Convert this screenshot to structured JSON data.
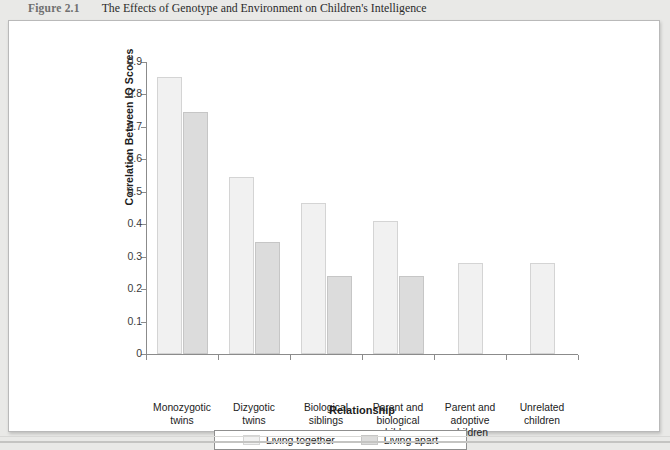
{
  "caption": {
    "figure_number": "Figure 2.1",
    "title": "The Effects of Genotype and Environment on Children's Intelligence"
  },
  "legend": {
    "position": "bottom-center",
    "items": [
      {
        "label": "Living together",
        "swatch": "#f1f1f1"
      },
      {
        "label": "Living apart",
        "swatch": "#dcdcdc"
      }
    ]
  },
  "chart_data": {
    "type": "bar",
    "title": "The Effects of Genotype and Environment on Children's Intelligence",
    "xlabel": "Relationship",
    "ylabel": "Correlation Between IQ Scores",
    "ylim": [
      0,
      0.9
    ],
    "ytick_labels": [
      "0",
      "0.1",
      "0.2",
      "0.3",
      "0.4",
      "0.5",
      "0.6",
      "0.7",
      "0.8",
      "0.9"
    ],
    "ytick_values": [
      0,
      0.1,
      0.2,
      0.3,
      0.4,
      0.5,
      0.6,
      0.7,
      0.8,
      0.9
    ],
    "grid": false,
    "categories": [
      "Monozygotic twins",
      "Dizygotic twins",
      "Biological siblings",
      "Parent and biological children",
      "Parent and adoptive children",
      "Unrelated children"
    ],
    "category_lines": [
      [
        "Monozygotic",
        "twins"
      ],
      [
        "Dizygotic",
        "twins"
      ],
      [
        "Biological",
        "siblings"
      ],
      [
        "Parent and",
        "biological",
        "children"
      ],
      [
        "Parent and",
        "adoptive",
        "children"
      ],
      [
        "Unrelated",
        "children"
      ]
    ],
    "series": [
      {
        "name": "Living together",
        "color": "#f1f1f1",
        "values": [
          0.855,
          0.545,
          0.465,
          0.41,
          0.28,
          0.28
        ]
      },
      {
        "name": "Living apart",
        "color": "#dcdcdc",
        "values": [
          0.745,
          0.345,
          0.24,
          0.24,
          null,
          null
        ]
      }
    ]
  }
}
